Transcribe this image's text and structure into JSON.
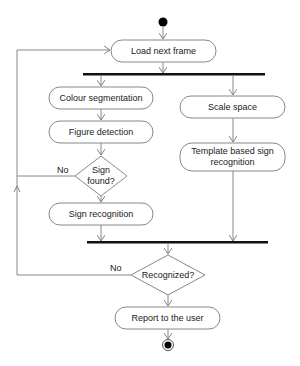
{
  "diagram": {
    "type": "uml-activity",
    "nodes": {
      "load": {
        "label": "Load next frame"
      },
      "colour": {
        "label": "Colour segmentation"
      },
      "figure": {
        "label": "Figure detection"
      },
      "sign_found": {
        "line1": "Sign",
        "line2": "found?"
      },
      "sign_recog": {
        "label": "Sign recognition"
      },
      "scale": {
        "label": "Scale space"
      },
      "template": {
        "line1": "Template based sign",
        "line2": "recognition"
      },
      "recognized": {
        "label": "Recognized?"
      },
      "report": {
        "label": "Report to the user"
      }
    },
    "edge_labels": {
      "sign_found_no": "No",
      "recognized_no": "No"
    },
    "colors": {
      "stroke": "#888888",
      "bar": "#111111",
      "text": "#1a1a1a"
    }
  }
}
